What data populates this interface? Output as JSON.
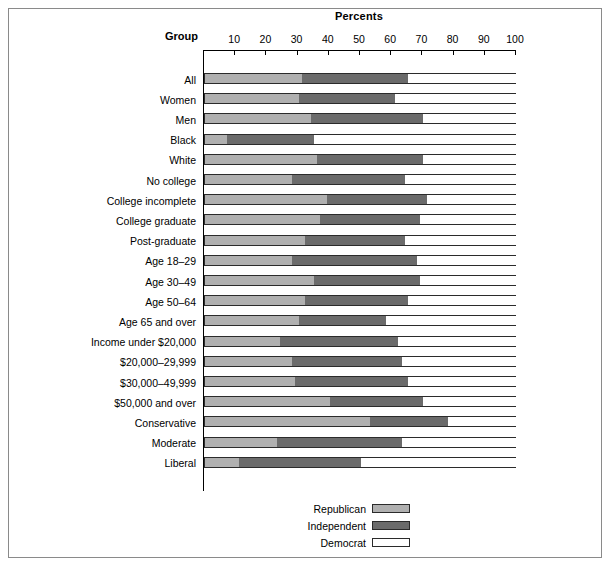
{
  "figure": {
    "percents_title": "Percents",
    "group_title": "Group"
  },
  "chart_data": {
    "type": "bar",
    "subtype": "stacked-horizontal-100",
    "title": "Percents",
    "xlabel": "Percents",
    "ylabel": "Group",
    "xlim": [
      0,
      100
    ],
    "xticks": [
      10,
      20,
      30,
      40,
      50,
      60,
      70,
      80,
      90,
      100
    ],
    "grid": false,
    "legend_position": "bottom",
    "orientation": "horizontal",
    "categories": [
      "All",
      "Women",
      "Men",
      "Black",
      "White",
      "No college",
      "College incomplete",
      "College graduate",
      "Post-graduate",
      "Age 18–29",
      "Age 30–49",
      "Age 50–64",
      "Age 65 and over",
      "Income under $20,000",
      "$20,000–29,999",
      "$30,000–49,999",
      "$50,000 and over",
      "Conservative",
      "Moderate",
      "Liberal"
    ],
    "series": [
      {
        "name": "Republican",
        "color": "#b0b0b0",
        "values": [
          31,
          30,
          34,
          7,
          36,
          28,
          39,
          37,
          32,
          28,
          35,
          32,
          30,
          24,
          28,
          29,
          40,
          53,
          23,
          11
        ]
      },
      {
        "name": "Independent",
        "color": "#6b6b6b",
        "values": [
          34,
          31,
          36,
          28,
          34,
          36,
          32,
          32,
          32,
          40,
          34,
          33,
          28,
          38,
          35,
          36,
          30,
          25,
          40,
          39
        ]
      },
      {
        "name": "Democrat",
        "color": "#ffffff",
        "values": [
          35,
          39,
          30,
          65,
          30,
          36,
          29,
          31,
          36,
          32,
          31,
          35,
          42,
          38,
          37,
          35,
          30,
          22,
          37,
          50
        ]
      }
    ]
  },
  "legend": {
    "entries": [
      {
        "label": "Republican",
        "color": "#b0b0b0"
      },
      {
        "label": "Independent",
        "color": "#6b6b6b"
      },
      {
        "label": "Democrat",
        "color": "#ffffff"
      }
    ]
  }
}
